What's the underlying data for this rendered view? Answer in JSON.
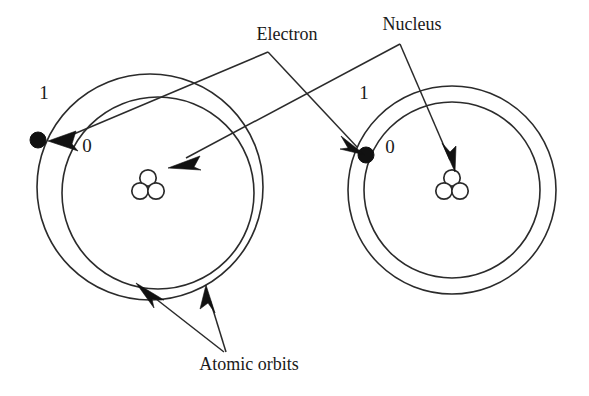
{
  "figure": {
    "kind": "atomic-orbit-diagram",
    "background_color": "#ffffff",
    "ink_color": "#2b2b2b",
    "electron_color": "#111111",
    "width": 589,
    "height": 396
  },
  "labels": {
    "electron": "Electron",
    "nucleus": "Nucleus",
    "atomic_orbits": "Atomic orbits"
  },
  "atoms": [
    {
      "id": "left-atom",
      "shell_outer_label": "1",
      "shell_inner_label": "0",
      "electron_shell": "1",
      "nucleus_parts": 3
    },
    {
      "id": "right-atom",
      "shell_outer_label": "1",
      "shell_inner_label": "0",
      "electron_shell": "0",
      "nucleus_parts": 3
    }
  ]
}
